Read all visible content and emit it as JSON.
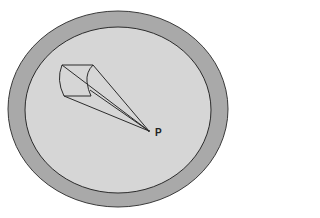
{
  "diagram": {
    "colors": {
      "background": "#ffffff",
      "outer_ring": "#a9a9a9",
      "inner_region": "#d6d6d6",
      "stroke": "#2b2b2b"
    },
    "outer_ellipse": {
      "cx": 118,
      "cy": 109,
      "rx": 110,
      "ry": 98
    },
    "inner_ellipse": {
      "cx": 118,
      "cy": 110,
      "rx": 93,
      "ry": 83
    },
    "cylinder": {
      "top_left": [
        62,
        65
      ],
      "top_right": [
        93,
        65
      ],
      "bottom_left": [
        64,
        96
      ],
      "bottom_right": [
        91,
        96
      ]
    },
    "point": {
      "x": 149,
      "y": 131,
      "label": "P"
    },
    "labels": {
      "point_label": "P"
    }
  }
}
